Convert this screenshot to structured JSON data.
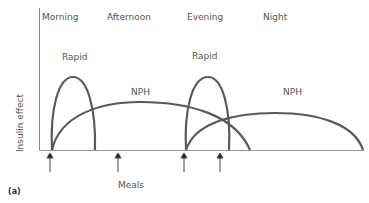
{
  "diagram": {
    "periods": [
      "Morning",
      "Afternoon",
      "Evening",
      "Night"
    ],
    "curve_labels": {
      "rapid_1": "Rapid",
      "rapid_2": "Rapid",
      "nph_1": "NPH",
      "nph_2": "NPH"
    },
    "y_axis_label": "Insulin effect",
    "x_axis_label": "Meals",
    "panel_label": "(a)",
    "curve_color": "#5a5a5a",
    "axis_color": "#888888"
  }
}
